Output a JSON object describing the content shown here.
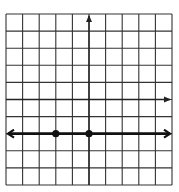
{
  "chart_data": {
    "type": "line",
    "title": "",
    "xlabel": "",
    "ylabel": "",
    "grid": true,
    "grid_cols": 10,
    "grid_rows": 10,
    "xlim": [
      -5,
      5
    ],
    "ylim": [
      -5,
      5
    ],
    "axes": {
      "x_axis_row_from_top": 5,
      "y_axis_col_from_left": 5,
      "x_axis_arrow": "right",
      "y_axis_arrow": "up"
    },
    "series": [
      {
        "name": "horizontal line y = -2",
        "kind": "line",
        "equation": "y = -2",
        "arrows": "both",
        "points": [
          {
            "x": -2,
            "y": -2
          },
          {
            "x": 0,
            "y": -2
          }
        ]
      }
    ],
    "legend": []
  },
  "colors": {
    "grid": "#333333",
    "axis": "#222222",
    "line": "#111111",
    "background": "#ffffff"
  }
}
